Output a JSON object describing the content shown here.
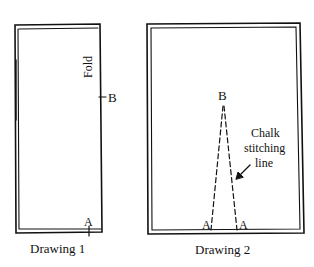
{
  "drawing1": {
    "caption": "Drawing 1",
    "fold_label": "Fold",
    "point_b": "B",
    "point_a": "A"
  },
  "drawing2": {
    "caption": "Drawing 2",
    "point_b": "B",
    "point_a_left": "A",
    "point_a_right": "A",
    "annotation_line1": "Chalk",
    "annotation_line2": "stitching",
    "annotation_line3": "line"
  },
  "colors": {
    "ink": "#111111",
    "background": "#ffffff"
  }
}
